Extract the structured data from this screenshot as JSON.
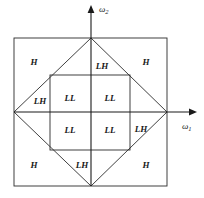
{
  "figure": {
    "background_color": "#ffffff",
    "line_color": "#2b2b2b",
    "text_color": "#1a1a1a"
  },
  "axes": {
    "horizontal": {
      "name": "omega-1",
      "label_base": "ω",
      "label_sub": "1",
      "label_x": 182,
      "label_y": 127,
      "from_x": 14,
      "to_x": 197,
      "y": 112
    },
    "vertical": {
      "name": "omega-2",
      "label_base": "ω",
      "label_sub": "2",
      "label_x": 99,
      "label_y": 10,
      "from_y": 186,
      "to_y": 5,
      "x": 91
    }
  },
  "outer_square": {
    "x": 14,
    "y": 38,
    "width": 153,
    "height": 148
  },
  "inner_square": {
    "x": 50,
    "y": 75,
    "width": 80,
    "height": 75
  },
  "diamond": {
    "top": {
      "x": 91,
      "y": 38
    },
    "right": {
      "x": 167,
      "y": 112
    },
    "bottom": {
      "x": 91,
      "y": 186
    },
    "left": {
      "x": 14,
      "y": 112
    }
  },
  "labels": [
    {
      "id": "h-top-left",
      "text": "H",
      "x": 34,
      "y": 63
    },
    {
      "id": "lh-top",
      "text": "LH",
      "x": 102,
      "y": 67
    },
    {
      "id": "h-top-right",
      "text": "H",
      "x": 146,
      "y": 63
    },
    {
      "id": "lh-left",
      "text": "LH",
      "x": 40,
      "y": 102
    },
    {
      "id": "ll-top-left",
      "text": "LL",
      "x": 70,
      "y": 99
    },
    {
      "id": "ll-top-right",
      "text": "LL",
      "x": 110,
      "y": 99
    },
    {
      "id": "ll-bottom-left",
      "text": "LL",
      "x": 70,
      "y": 131
    },
    {
      "id": "ll-bottom-right",
      "text": "LL",
      "x": 110,
      "y": 131
    },
    {
      "id": "lh-right",
      "text": "LH",
      "x": 141,
      "y": 130
    },
    {
      "id": "h-bottom-left",
      "text": "H",
      "x": 34,
      "y": 166
    },
    {
      "id": "lh-bottom",
      "text": "LH",
      "x": 82,
      "y": 166
    },
    {
      "id": "h-bottom-right",
      "text": "H",
      "x": 146,
      "y": 166
    }
  ]
}
